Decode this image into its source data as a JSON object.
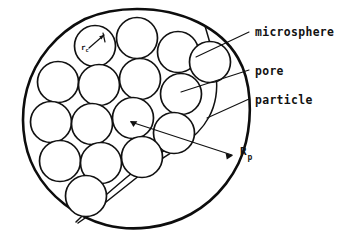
{
  "figure": {
    "kind": "schematic-diagram",
    "background_color": "#ffffff",
    "ink_color": "#111111"
  },
  "labels": {
    "microsphere": "microsphere",
    "pore": "pore",
    "particle": "particle",
    "particle_radius_symbol": "R",
    "particle_radius_subscript": "p",
    "microsphere_radius_symbol": "r",
    "microsphere_radius_subscript": "c"
  },
  "geometry": {
    "particle": {
      "cx": 137,
      "cy": 121,
      "r": 112
    },
    "microsphere_radius": 20.5,
    "microspheres": [
      {
        "cx": 95,
        "cy": 46
      },
      {
        "cx": 137,
        "cy": 38
      },
      {
        "cx": 178,
        "cy": 52
      },
      {
        "cx": 210,
        "cy": 62
      },
      {
        "cx": 58,
        "cy": 82
      },
      {
        "cx": 99,
        "cy": 85
      },
      {
        "cx": 140,
        "cy": 79
      },
      {
        "cx": 181,
        "cy": 94
      },
      {
        "cx": 51,
        "cy": 122
      },
      {
        "cx": 92,
        "cy": 124
      },
      {
        "cx": 133,
        "cy": 118
      },
      {
        "cx": 174,
        "cy": 133
      },
      {
        "cx": 60,
        "cy": 161
      },
      {
        "cx": 101,
        "cy": 163
      },
      {
        "cx": 142,
        "cy": 157
      },
      {
        "cx": 86,
        "cy": 196
      }
    ]
  },
  "annotations": {
    "particle_radius_arrow": {
      "from_x": 130,
      "from_y": 122,
      "to_x": 232,
      "to_y": 155,
      "double_headed": true
    },
    "microsphere_radius_arrow": {
      "from_x": 88,
      "from_y": 47,
      "to_x": 104,
      "to_y": 36
    },
    "leaders": [
      {
        "name": "microsphere",
        "x1": 196,
        "y1": 57,
        "x2": 248,
        "y2": 32
      },
      {
        "name": "pore",
        "x1": 182,
        "y1": 92,
        "x2": 248,
        "y2": 70
      },
      {
        "name": "particle",
        "x1": 206,
        "y1": 118,
        "x2": 248,
        "y2": 99
      }
    ]
  }
}
